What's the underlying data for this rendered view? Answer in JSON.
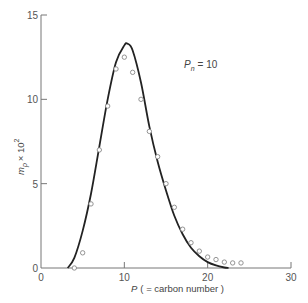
{
  "chart_data": {
    "type": "scatter",
    "title": "",
    "xlabel": "P ( = carbon number )",
    "xlabel_italic": "P",
    "xlabel_rest": "( = carbon number )",
    "ylabel": "m_p × 10^2",
    "ylabel_base": "m",
    "ylabel_sub": "p",
    "ylabel_mult": "× 10",
    "ylabel_sup": "2",
    "xlim": [
      0,
      30
    ],
    "ylim": [
      0,
      15
    ],
    "x_ticks": [
      0,
      10,
      20,
      30
    ],
    "x_tick_labels": [
      "0",
      "10",
      "20",
      "30"
    ],
    "y_ticks": [
      0,
      5,
      10,
      15
    ],
    "y_tick_labels": [
      "0",
      "5",
      "10",
      "15"
    ],
    "grid": false,
    "annotation": {
      "symbol": "P",
      "subscript": "n",
      "text": "= 10",
      "x": 17.0,
      "y": 12.2
    },
    "series": [
      {
        "name": "experimental",
        "style": "open-circles",
        "x": [
          4,
          5,
          6,
          7,
          8,
          9,
          10,
          11,
          12,
          13,
          14,
          15,
          16,
          17,
          18,
          19,
          20,
          21,
          22,
          23,
          24
        ],
        "y": [
          0.0,
          0.9,
          3.8,
          7.0,
          9.6,
          11.8,
          12.5,
          11.6,
          10.0,
          8.1,
          6.6,
          5.0,
          3.6,
          2.3,
          1.5,
          1.0,
          0.65,
          0.5,
          0.35,
          0.3,
          0.3
        ]
      },
      {
        "name": "theoretical curve",
        "style": "solid-line",
        "x": [
          3.2,
          4,
          5,
          6,
          7,
          8,
          9,
          10,
          10.4,
          11,
          12,
          13,
          14,
          15,
          16,
          17,
          18,
          19,
          20,
          21,
          22,
          22.5
        ],
        "y": [
          0.0,
          0.6,
          2.2,
          4.4,
          7.2,
          10.0,
          12.2,
          13.2,
          13.3,
          12.9,
          11.0,
          8.4,
          6.3,
          4.6,
          3.1,
          2.0,
          1.2,
          0.7,
          0.35,
          0.15,
          0.03,
          0.0
        ]
      }
    ],
    "colors": {
      "axis": "#777777",
      "curve": "#222222",
      "marker": "#888888",
      "text": "#555555"
    }
  }
}
